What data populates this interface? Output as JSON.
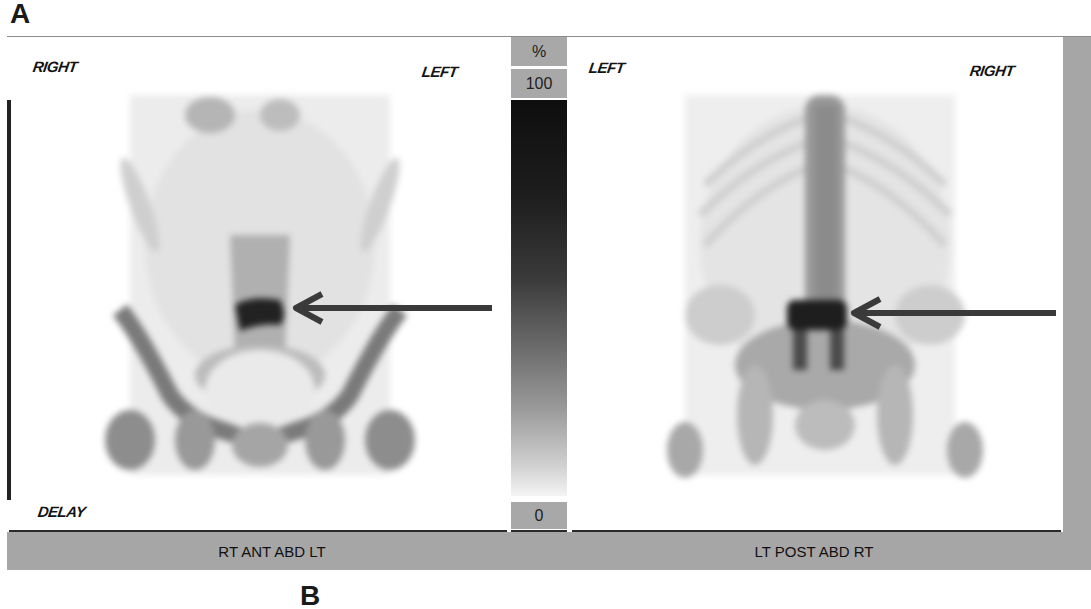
{
  "figure": {
    "label": "A",
    "bottom_label_partial": "B"
  },
  "colorbar": {
    "unit": "%",
    "max": "100",
    "min": "0",
    "gradient_top": "#0e0e0e",
    "gradient_bottom": "#f4f4f4"
  },
  "panels": [
    {
      "id": "anterior",
      "top_left_orientation": "RIGHT",
      "top_right_orientation": "LEFT",
      "bottom_left_tag": "DELAY",
      "caption": "RT ANT ABD LT",
      "arrow_target": "lumbosacral hot spot"
    },
    {
      "id": "posterior",
      "top_left_orientation": "LEFT",
      "top_right_orientation": "RIGHT",
      "caption": "LT POST ABD RT",
      "arrow_target": "lumbar vertebral hot spot"
    }
  ],
  "colors": {
    "caption_bar": "#a6a6a6",
    "arrow": "#3a3a3a",
    "text": "#141414"
  }
}
